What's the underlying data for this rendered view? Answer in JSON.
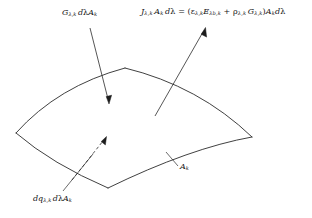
{
  "figure": {
    "type": "radiation-surface-energy-balance-diagram",
    "background_color": "#ffffff",
    "line_color": "#2b2b2b",
    "labels": {
      "irradiation": {
        "name": "irradiation-label",
        "plain": "Gλ,k dλAk",
        "parts": [
          {
            "t": "G",
            "style": "italic"
          },
          {
            "t": "λ,k",
            "style": "sub"
          },
          {
            "t": " ",
            "style": "space"
          },
          {
            "t": "d",
            "style": "italic"
          },
          {
            "t": "λA",
            "style": "italic"
          },
          {
            "t": "k",
            "style": "sub"
          }
        ]
      },
      "radiosity_equation": {
        "name": "radiosity-equation-label",
        "plain": "Jλ,k Ak dλ = (ελ,k Eλb,k + ρλ,k Gλ,k)Ak dλ",
        "left_side": "Jλ,k Ak dλ",
        "right_side": "(ελ,k Eλb,k + ρλ,k Gλ,k)Ak dλ",
        "terms": {
          "radiosity_symbol": "J",
          "area_symbol": "A",
          "wavelength_symbol": "λ",
          "emissivity_symbol": "ε",
          "blackbody_emissive_power_symbol": "E",
          "reflectivity_symbol": "ρ",
          "irradiation_symbol": "G",
          "subscript": "λ,k",
          "blackbody_subscript": "λb,k"
        }
      },
      "net_flux": {
        "name": "net-flux-label",
        "plain": "dqλ,k dλAk",
        "parts": [
          {
            "t": "dq",
            "style": "italic"
          },
          {
            "t": "λ,k",
            "style": "sub"
          },
          {
            "t": " ",
            "style": "space"
          },
          {
            "t": "dλA",
            "style": "italic"
          },
          {
            "t": "k",
            "style": "sub"
          }
        ]
      },
      "area": {
        "name": "area-label",
        "plain": "Ak",
        "symbol": "A",
        "subscript": "k"
      }
    },
    "arrows": [
      {
        "name": "irradiation-arrow",
        "style": "solid",
        "direction": "incoming-down-right",
        "from": [
          90,
          28
        ],
        "to": [
          109,
          103
        ]
      },
      {
        "name": "radiosity-arrow",
        "style": "solid",
        "direction": "outgoing-up-right",
        "from": [
          155,
          116
        ],
        "to": [
          205,
          28
        ]
      },
      {
        "name": "net-flux-arrow",
        "style": "dashed",
        "direction": "outgoing-up-right",
        "from": [
          72,
          180
        ],
        "to": [
          106,
          137
        ]
      }
    ],
    "leader_lines": [
      {
        "name": "net-flux-leader",
        "from": [
          63,
          191
        ],
        "to": [
          92,
          155
        ]
      },
      {
        "name": "area-leader",
        "from": [
          166,
          152
        ],
        "to": [
          178,
          166
        ]
      }
    ],
    "surface": {
      "name": "curved-surface-patch",
      "description": "saddle-shaped curved quadrilateral surface element",
      "vertices": {
        "left": [
          16,
          133
        ],
        "top": [
          125,
          68
        ],
        "right": [
          252,
          137
        ],
        "bottom": [
          108,
          188
        ]
      }
    }
  }
}
